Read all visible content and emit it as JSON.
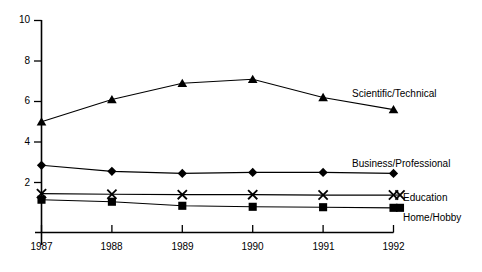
{
  "chart_data": {
    "type": "line",
    "title": "",
    "subtitle": "",
    "xlabel": "",
    "ylabel": "",
    "categories": [
      "1987",
      "1988",
      "1989",
      "1990",
      "1991",
      "1992"
    ],
    "x": [
      1987,
      1988,
      1989,
      1990,
      1991,
      1992
    ],
    "ylim": [
      0,
      10
    ],
    "xlim": [
      1987,
      1992
    ],
    "yticks": [
      "2",
      "4",
      "6",
      "8",
      "10"
    ],
    "ytick_values": [
      2,
      4,
      6,
      8,
      10
    ],
    "grid": false,
    "legend_position": "right-inline-end-of-line",
    "series": [
      {
        "name": "Scientific/Technical",
        "marker": "triangle",
        "color": "#000000",
        "values": [
          5.0,
          6.1,
          6.9,
          7.1,
          6.2,
          5.6
        ]
      },
      {
        "name": "Business/Professional",
        "marker": "diamond",
        "color": "#000000",
        "values": [
          2.85,
          2.55,
          2.45,
          2.5,
          2.5,
          2.45
        ]
      },
      {
        "name": "Education",
        "marker": "x",
        "color": "#000000",
        "values": [
          1.45,
          1.42,
          1.4,
          1.4,
          1.38,
          1.38
        ]
      },
      {
        "name": "Home/Hobby",
        "marker": "square",
        "color": "#000000",
        "values": [
          1.15,
          1.05,
          0.85,
          0.8,
          0.78,
          0.75
        ]
      }
    ]
  },
  "axes": {
    "y_tick_labels": [
      "10",
      "8",
      "6",
      "4",
      "2"
    ],
    "x_tick_labels": [
      "1987",
      "1988",
      "1989",
      "1990",
      "1991",
      "1992"
    ],
    "axis_color": "#000000"
  },
  "legend": {
    "items": [
      {
        "label": "Scientific/Technical",
        "marker": "triangle"
      },
      {
        "label": "Business/Professional",
        "marker": "diamond"
      },
      {
        "label": "Education",
        "marker": "x"
      },
      {
        "label": "Home/Hobby",
        "marker": "square"
      }
    ]
  }
}
